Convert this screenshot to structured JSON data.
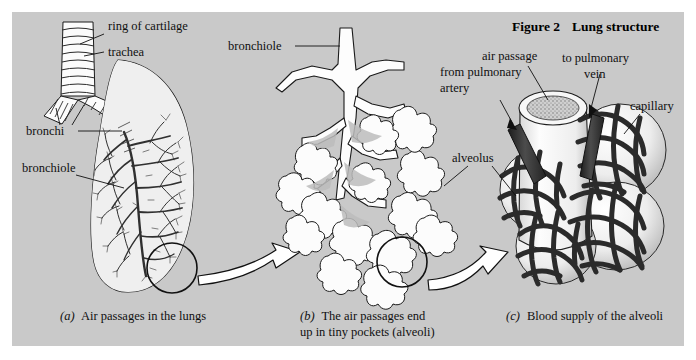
{
  "figure": {
    "title_prefix": "Figure 2",
    "title_text": "Lung structure",
    "background_color": "#c9c9c9",
    "page_color": "#ffffff",
    "ink_color": "#1a1a1a",
    "vessel_color": "#3a3a3a",
    "panel_count": 3
  },
  "panel_a": {
    "id": "a",
    "caption_marker": "(a)",
    "caption_text": "Air passages in the lungs",
    "labels": [
      {
        "name": "ring-of-cartilage",
        "text": "ring of cartilage"
      },
      {
        "name": "trachea",
        "text": "trachea"
      },
      {
        "name": "bronchi",
        "text": "bronchi"
      },
      {
        "name": "bronchiole",
        "text": "bronchiole"
      }
    ]
  },
  "panel_b": {
    "id": "b",
    "caption_marker": "(b)",
    "caption_line1": "The air passages end",
    "caption_line2": "up in tiny pockets (alveoli)",
    "labels": [
      {
        "name": "bronchiole",
        "text": "bronchiole"
      }
    ]
  },
  "panel_c": {
    "id": "c",
    "caption_marker": "(c)",
    "caption_text": "Blood supply of the alveoli",
    "labels": [
      {
        "name": "air-passage",
        "text": "air passage"
      },
      {
        "name": "from-pulmonary-artery-line1",
        "text": "from pulmonary"
      },
      {
        "name": "from-pulmonary-artery-line2",
        "text": "artery"
      },
      {
        "name": "to-pulmonary-vein-line1",
        "text": "to pulmonary"
      },
      {
        "name": "to-pulmonary-vein-line2",
        "text": "vein"
      },
      {
        "name": "capillary",
        "text": "capillary"
      },
      {
        "name": "alveolus",
        "text": "alveolus"
      }
    ]
  },
  "connectors": [
    {
      "name": "zoom-arrow-a-to-b"
    },
    {
      "name": "zoom-arrow-b-to-c"
    }
  ]
}
